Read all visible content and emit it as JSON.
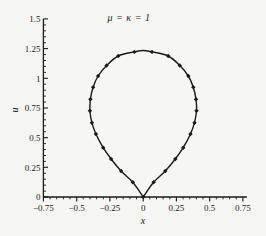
{
  "figure": {
    "background_color": "#f6f6f4",
    "ink_color": "#1b1b1b"
  },
  "chart_data": {
    "type": "line",
    "title": "μ = κ = 1",
    "xlabel": "x",
    "ylabel": "u",
    "xlim": [
      -0.75,
      0.75
    ],
    "ylim": [
      0,
      1.5
    ],
    "x_major_ticks": [
      -0.75,
      -0.5,
      -0.25,
      0,
      0.25,
      0.5,
      0.75
    ],
    "x_tick_labels": [
      "−0.75",
      "−0.5",
      "−0.25",
      "0",
      "0.25",
      "0.5",
      "0.75"
    ],
    "y_major_ticks": [
      0,
      0.25,
      0.5,
      0.75,
      1,
      1.25,
      1.5
    ],
    "y_tick_labels": [
      "0",
      "0.25",
      "0.5",
      "0.75",
      "1",
      "1.25",
      "1.5"
    ],
    "minor_tick_step": 0.05,
    "grid": false,
    "legend": "none",
    "marker_style": "filled-diamond",
    "curve_shape": "closed teardrop loop, cusp corner at origin, rounded apex at top",
    "apex": [
      0,
      1.234
    ],
    "series": [
      {
        "name": "loop solution",
        "points": [
          [
            0.0,
            0.0
          ],
          [
            0.078,
            0.124
          ],
          [
            0.166,
            0.219
          ],
          [
            0.241,
            0.32
          ],
          [
            0.301,
            0.415
          ],
          [
            0.356,
            0.531
          ],
          [
            0.386,
            0.626
          ],
          [
            0.401,
            0.727
          ],
          [
            0.397,
            0.823
          ],
          [
            0.377,
            0.924
          ],
          [
            0.339,
            1.019
          ],
          [
            0.275,
            1.108
          ],
          [
            0.188,
            1.188
          ],
          [
            0.066,
            1.222
          ],
          [
            -0.066,
            1.222
          ],
          [
            -0.188,
            1.188
          ],
          [
            -0.275,
            1.108
          ],
          [
            -0.339,
            1.019
          ],
          [
            -0.377,
            0.924
          ],
          [
            -0.397,
            0.823
          ],
          [
            -0.401,
            0.727
          ],
          [
            -0.386,
            0.626
          ],
          [
            -0.356,
            0.531
          ],
          [
            -0.301,
            0.415
          ],
          [
            -0.241,
            0.32
          ],
          [
            -0.166,
            0.219
          ],
          [
            -0.078,
            0.124
          ]
        ]
      }
    ]
  }
}
